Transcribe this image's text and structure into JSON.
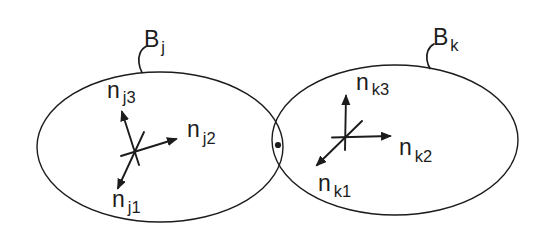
{
  "diagram": {
    "colors": {
      "ink": "#1c1c1c",
      "background": "#ffffff"
    },
    "body_j": {
      "label": {
        "main": "B",
        "sub": "j"
      },
      "axes": [
        {
          "main": "n",
          "sub": "j1"
        },
        {
          "main": "n",
          "sub": "j2"
        },
        {
          "main": "n",
          "sub": "j3"
        }
      ]
    },
    "body_k": {
      "label": {
        "main": "B",
        "sub": "k"
      },
      "axes": [
        {
          "main": "n",
          "sub": "k1"
        },
        {
          "main": "n",
          "sub": "k2"
        },
        {
          "main": "n",
          "sub": "k3"
        }
      ]
    },
    "contact_point": {
      "marker": "dot"
    }
  }
}
